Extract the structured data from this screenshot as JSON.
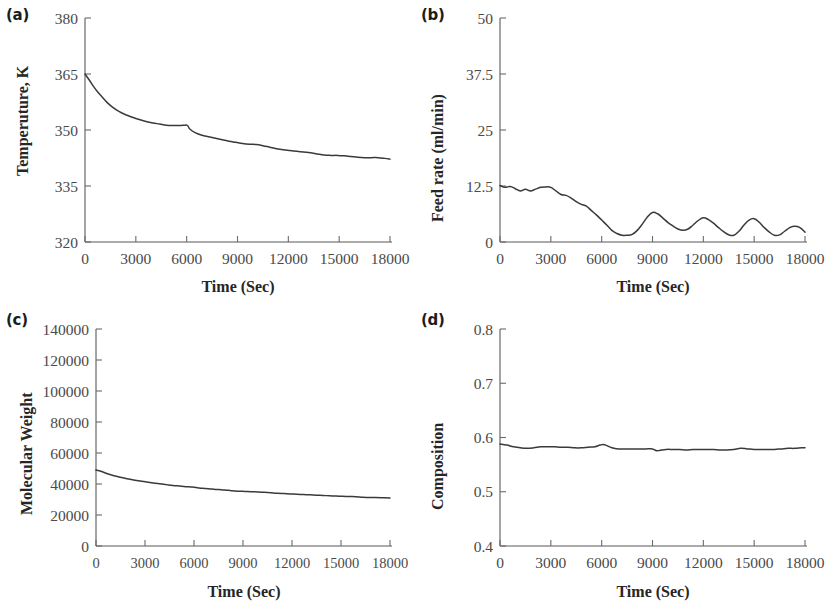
{
  "figure": {
    "background": "#ffffff",
    "line_color": "#3a3a3a",
    "axis_color": "#595959",
    "panel_count": 4
  },
  "panels": {
    "a": {
      "label": "(a)",
      "ylabel": "Temperuture, K",
      "xlabel": "Time (Sec)",
      "yticks": [
        "320",
        "335",
        "350",
        "365",
        "380"
      ],
      "xticks": [
        "0",
        "3000",
        "6000",
        "9000",
        "12000",
        "15000",
        "18000"
      ]
    },
    "b": {
      "label": "(b)",
      "ylabel": "Feed rate (ml/min)",
      "xlabel": "Time (Sec)",
      "yticks": [
        "0",
        "12.5",
        "25",
        "37.5",
        "50"
      ],
      "xticks": [
        "0",
        "3000",
        "6000",
        "9000",
        "12000",
        "15000",
        "18000"
      ]
    },
    "c": {
      "label": "(c)",
      "ylabel": "Molecular Weight",
      "xlabel": "Time (Sec)",
      "yticks": [
        "0",
        "20000",
        "40000",
        "60000",
        "80000",
        "100000",
        "120000",
        "140000"
      ],
      "xticks": [
        "0",
        "3000",
        "6000",
        "9000",
        "12000",
        "15000",
        "18000"
      ]
    },
    "d": {
      "label": "(d)",
      "ylabel": "Composition",
      "xlabel": "Time (Sec)",
      "yticks": [
        "0.4",
        "0.5",
        "0.6",
        "0.7",
        "0.8"
      ],
      "xticks": [
        "0",
        "3000",
        "6000",
        "9000",
        "12000",
        "15000",
        "18000"
      ]
    }
  },
  "chart_data": [
    {
      "type": "line",
      "panel": "a",
      "title": "(a)",
      "xlabel": "Time (Sec)",
      "ylabel": "Temperuture, K",
      "xlim": [
        0,
        18000
      ],
      "ylim": [
        320,
        380
      ],
      "xticks": [
        0,
        3000,
        6000,
        9000,
        12000,
        15000,
        18000
      ],
      "yticks": [
        320,
        335,
        350,
        365,
        380
      ],
      "grid": false,
      "legend": null,
      "x": [
        0,
        250,
        500,
        750,
        1000,
        1300,
        1600,
        2000,
        2400,
        2800,
        3200,
        3600,
        4000,
        4400,
        4800,
        5200,
        5600,
        5900,
        6050,
        6200,
        6500,
        6900,
        7300,
        7700,
        8100,
        8500,
        8900,
        9300,
        9700,
        10100,
        10500,
        10900,
        11300,
        11700,
        12100,
        12500,
        12900,
        13300,
        13700,
        14100,
        14500,
        14900,
        15300,
        15700,
        16100,
        16500,
        16900,
        17300,
        17700,
        18000
      ],
      "y": [
        365.0,
        363.4,
        361.7,
        360.2,
        358.9,
        357.4,
        356.2,
        355.0,
        354.1,
        353.4,
        352.8,
        352.3,
        351.9,
        351.6,
        351.3,
        351.2,
        351.2,
        351.3,
        351.2,
        350.2,
        349.3,
        348.6,
        348.2,
        347.8,
        347.4,
        347.0,
        346.7,
        346.4,
        346.2,
        346.1,
        345.8,
        345.4,
        345.0,
        344.7,
        344.5,
        344.3,
        344.1,
        343.9,
        343.6,
        343.3,
        343.2,
        343.2,
        343.1,
        342.9,
        342.7,
        342.6,
        342.6,
        342.6,
        342.4,
        342.2
      ]
    },
    {
      "type": "line",
      "panel": "b",
      "title": "(b)",
      "xlabel": "Time (Sec)",
      "ylabel": "Feed rate (ml/min)",
      "xlim": [
        0,
        18000
      ],
      "ylim": [
        0,
        50
      ],
      "xticks": [
        0,
        3000,
        6000,
        9000,
        12000,
        15000,
        18000
      ],
      "yticks": [
        0,
        12.5,
        25,
        37.5,
        50
      ],
      "grid": false,
      "legend": null,
      "x": [
        0,
        300,
        600,
        900,
        1200,
        1500,
        1800,
        2100,
        2400,
        2700,
        3000,
        3300,
        3600,
        3900,
        4200,
        4500,
        4800,
        5100,
        5400,
        5700,
        6000,
        6300,
        6600,
        6900,
        7200,
        7500,
        7800,
        8100,
        8400,
        8700,
        9000,
        9300,
        9600,
        9900,
        10200,
        10500,
        10800,
        11100,
        11400,
        11700,
        12000,
        12300,
        12600,
        12900,
        13200,
        13500,
        13800,
        14100,
        14400,
        14700,
        15000,
        15300,
        15600,
        15900,
        16200,
        16500,
        16800,
        17100,
        17400,
        17700,
        18000
      ],
      "y": [
        12.6,
        12.2,
        12.4,
        11.9,
        11.4,
        11.8,
        11.4,
        11.8,
        12.2,
        12.3,
        12.2,
        11.4,
        10.6,
        10.4,
        9.8,
        9.0,
        8.4,
        8.0,
        7.0,
        6.0,
        4.9,
        3.8,
        2.6,
        1.9,
        1.5,
        1.5,
        1.7,
        2.6,
        4.0,
        5.6,
        6.6,
        6.3,
        5.4,
        4.4,
        3.6,
        2.9,
        2.6,
        2.9,
        3.8,
        4.8,
        5.4,
        5.0,
        4.2,
        3.2,
        2.3,
        1.6,
        1.5,
        2.4,
        3.8,
        4.9,
        5.2,
        4.4,
        3.2,
        2.2,
        1.5,
        1.6,
        2.4,
        3.2,
        3.5,
        3.2,
        2.2
      ]
    },
    {
      "type": "line",
      "panel": "c",
      "title": "(c)",
      "xlabel": "Time (Sec)",
      "ylabel": "Molecular Weight",
      "xlim": [
        0,
        18000
      ],
      "ylim": [
        0,
        140000
      ],
      "xticks": [
        0,
        3000,
        6000,
        9000,
        12000,
        15000,
        18000
      ],
      "yticks": [
        0,
        20000,
        40000,
        60000,
        80000,
        100000,
        120000,
        140000
      ],
      "grid": false,
      "legend": null,
      "x": [
        0,
        300,
        700,
        1100,
        1500,
        1900,
        2300,
        2700,
        3100,
        3500,
        3900,
        4300,
        4700,
        5100,
        5500,
        5900,
        6300,
        6700,
        7100,
        7500,
        7900,
        8300,
        8700,
        9100,
        9500,
        9900,
        10300,
        10700,
        11100,
        11500,
        11900,
        12300,
        12700,
        13100,
        13500,
        13900,
        14300,
        14700,
        15100,
        15500,
        15900,
        16300,
        16700,
        17100,
        17500,
        18000
      ],
      "y": [
        49000,
        48200,
        46600,
        45300,
        44300,
        43400,
        42600,
        41900,
        41300,
        40700,
        40100,
        39600,
        39100,
        38700,
        38300,
        38000,
        37500,
        37100,
        36700,
        36400,
        36100,
        35700,
        35400,
        35200,
        35000,
        34900,
        34600,
        34300,
        34000,
        33800,
        33600,
        33400,
        33200,
        33000,
        32800,
        32600,
        32400,
        32200,
        32100,
        31900,
        31800,
        31500,
        31300,
        31300,
        31200,
        31000
      ]
    },
    {
      "type": "line",
      "panel": "d",
      "title": "(d)",
      "xlabel": "Time (Sec)",
      "ylabel": "Composition",
      "xlim": [
        0,
        18000
      ],
      "ylim": [
        0.4,
        0.8
      ],
      "xticks": [
        0,
        3000,
        6000,
        9000,
        12000,
        15000,
        18000
      ],
      "yticks": [
        0.4,
        0.5,
        0.6,
        0.7,
        0.8
      ],
      "grid": false,
      "legend": null,
      "x": [
        0,
        400,
        800,
        1200,
        1600,
        2000,
        2400,
        2800,
        3200,
        3600,
        4000,
        4400,
        4800,
        5200,
        5600,
        5900,
        6100,
        6300,
        6600,
        7000,
        7400,
        7800,
        8200,
        8600,
        9000,
        9200,
        9400,
        9800,
        10200,
        10600,
        11000,
        11400,
        11800,
        12200,
        12600,
        13000,
        13400,
        13800,
        14200,
        14600,
        15000,
        15400,
        15800,
        16200,
        16600,
        17000,
        17400,
        17800,
        18000
      ],
      "y": [
        0.588,
        0.586,
        0.583,
        0.581,
        0.58,
        0.581,
        0.583,
        0.583,
        0.583,
        0.582,
        0.582,
        0.581,
        0.581,
        0.582,
        0.583,
        0.586,
        0.587,
        0.585,
        0.581,
        0.579,
        0.579,
        0.579,
        0.579,
        0.579,
        0.579,
        0.576,
        0.576,
        0.578,
        0.578,
        0.578,
        0.577,
        0.578,
        0.578,
        0.578,
        0.578,
        0.577,
        0.577,
        0.578,
        0.58,
        0.579,
        0.578,
        0.578,
        0.578,
        0.578,
        0.579,
        0.58,
        0.58,
        0.581,
        0.581
      ]
    }
  ]
}
